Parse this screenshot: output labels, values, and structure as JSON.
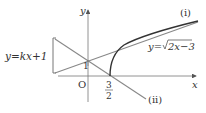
{
  "diagram": {
    "axes": {
      "x_label": "x",
      "y_label": "y",
      "origin_label": "O"
    },
    "labels": {
      "line_family": "y=kx+1",
      "curve": "y=√2x−3",
      "curve_prefix": "y=",
      "curve_radicand": "2x−3",
      "line_i": "(i)",
      "line_ii": "(ii)",
      "y_intercept": "1",
      "x_point_num": "3",
      "x_point_den": "2"
    },
    "colors": {
      "axis": "#555555",
      "curve": "#333333",
      "lines": "#777777",
      "text": "#333333"
    }
  }
}
